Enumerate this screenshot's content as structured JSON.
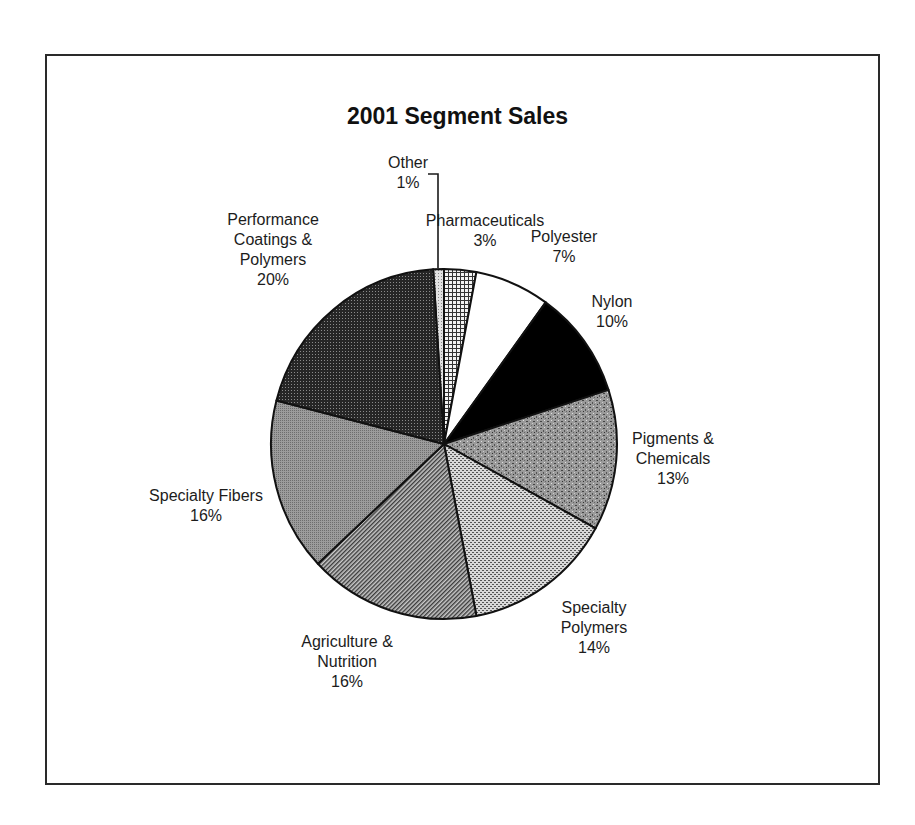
{
  "chart_data": {
    "type": "pie",
    "title": "2001 Segment Sales",
    "start_angle_deg": -3.6,
    "direction": "clockwise",
    "slices": [
      {
        "label": "Other",
        "value": 1,
        "pct_label": "1%",
        "fill": "#cfcfcf",
        "pattern": "light-dots"
      },
      {
        "label": "Pharmaceuticals",
        "value": 3,
        "pct_label": "3%",
        "fill": "#bdbdbd",
        "pattern": "grid"
      },
      {
        "label": "Polyester",
        "value": 7,
        "pct_label": "7%",
        "fill": "#ffffff",
        "pattern": "solid"
      },
      {
        "label": "Nylon",
        "value": 10,
        "pct_label": "10%",
        "fill": "#000000",
        "pattern": "solid"
      },
      {
        "label": "Pigments & Chemicals",
        "value": 13,
        "pct_label": "13%",
        "fill": "#8a8a8a",
        "pattern": "speckle"
      },
      {
        "label": "Specialty Polymers",
        "value": 14,
        "pct_label": "14%",
        "fill": "#b8b8b8",
        "pattern": "fine-dots"
      },
      {
        "label": "Agriculture & Nutrition",
        "value": 16,
        "pct_label": "16%",
        "fill": "#7a7a7a",
        "pattern": "diagonal"
      },
      {
        "label": "Specialty Fibers",
        "value": 16,
        "pct_label": "16%",
        "fill": "#8e8e8e",
        "pattern": "fine-gray"
      },
      {
        "label": "Performance Coatings & Polymers",
        "value": 20,
        "pct_label": "20%",
        "fill": "#2e2e2e",
        "pattern": "dark-dots"
      }
    ],
    "legend": "none (direct labels)"
  },
  "labels": {
    "title": "2001 Segment Sales",
    "other": {
      "line1": "Other",
      "pct": "1%"
    },
    "pharma": {
      "line1": "Pharmaceuticals",
      "pct": "3%"
    },
    "polyester": {
      "line1": "Polyester",
      "pct": "7%"
    },
    "nylon": {
      "line1": "Nylon",
      "pct": "10%"
    },
    "pigments": {
      "line1": "Pigments &",
      "line2": "Chemicals",
      "pct": "13%"
    },
    "specpoly": {
      "line1": "Specialty",
      "line2": "Polymers",
      "pct": "14%"
    },
    "agri": {
      "line1": "Agriculture &",
      "line2": "Nutrition",
      "pct": "16%"
    },
    "fibers": {
      "line1": "Specialty Fibers",
      "pct": "16%"
    },
    "perf": {
      "line1": "Performance",
      "line2": "Coatings &",
      "line3": "Polymers",
      "pct": "20%"
    }
  }
}
